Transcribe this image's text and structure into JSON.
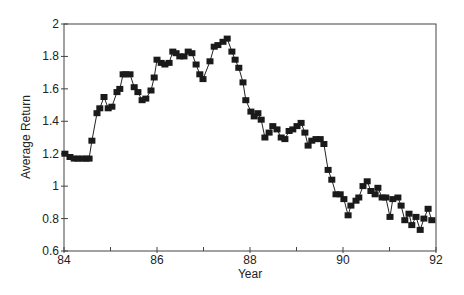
{
  "chart_data": {
    "type": "line",
    "title": "",
    "xlabel": "Year",
    "ylabel": "Average Return",
    "xlim": [
      84,
      92
    ],
    "ylim": [
      0.6,
      2
    ],
    "xticks": [
      84,
      86,
      88,
      90,
      92
    ],
    "xticks_minor": [
      85,
      87,
      89,
      91
    ],
    "yticks": [
      0.6,
      0.8,
      1,
      1.2,
      1.4,
      1.6,
      1.8,
      2
    ],
    "ytick_labels": [
      "0.6",
      "0.8",
      "1",
      "1.2",
      "1.4",
      "1.6",
      "1.8",
      "2"
    ],
    "xtick_labels": [
      "84",
      "86",
      "88",
      "90",
      "92"
    ],
    "grid": false,
    "legend": null,
    "marker": "square",
    "series": [
      {
        "name": "Average Return",
        "color": "#1a1a1a",
        "x": [
          84.02,
          84.13,
          84.22,
          84.3,
          84.39,
          84.47,
          84.54,
          84.6,
          84.71,
          84.77,
          84.86,
          84.95,
          85.03,
          85.14,
          85.2,
          85.27,
          85.33,
          85.42,
          85.51,
          85.59,
          85.68,
          85.76,
          85.87,
          85.94,
          86.0,
          86.09,
          86.17,
          86.26,
          86.34,
          86.41,
          86.49,
          86.58,
          86.67,
          86.75,
          86.84,
          86.92,
          86.99,
          87.14,
          87.23,
          87.31,
          87.42,
          87.51,
          87.61,
          87.68,
          87.76,
          87.85,
          87.91,
          88.02,
          88.09,
          88.17,
          88.24,
          88.32,
          88.41,
          88.49,
          88.58,
          88.67,
          88.75,
          88.84,
          88.92,
          89.01,
          89.1,
          89.18,
          89.25,
          89.33,
          89.42,
          89.51,
          89.59,
          89.68,
          89.76,
          89.85,
          89.94,
          90.02,
          90.11,
          90.17,
          90.28,
          90.34,
          90.43,
          90.52,
          90.6,
          90.69,
          90.75,
          90.84,
          90.92,
          91.01,
          91.07,
          91.18,
          91.25,
          91.33,
          91.42,
          91.48,
          91.57,
          91.66,
          91.74,
          91.83,
          91.91
        ],
        "values": [
          1.2,
          1.18,
          1.17,
          1.17,
          1.17,
          1.17,
          1.17,
          1.28,
          1.45,
          1.48,
          1.55,
          1.48,
          1.49,
          1.58,
          1.6,
          1.69,
          1.69,
          1.69,
          1.61,
          1.58,
          1.53,
          1.54,
          1.59,
          1.67,
          1.78,
          1.76,
          1.75,
          1.76,
          1.83,
          1.82,
          1.8,
          1.8,
          1.83,
          1.82,
          1.75,
          1.69,
          1.66,
          1.77,
          1.86,
          1.87,
          1.89,
          1.91,
          1.83,
          1.78,
          1.73,
          1.64,
          1.53,
          1.46,
          1.43,
          1.45,
          1.41,
          1.3,
          1.33,
          1.37,
          1.35,
          1.3,
          1.29,
          1.34,
          1.35,
          1.37,
          1.39,
          1.33,
          1.25,
          1.28,
          1.29,
          1.29,
          1.26,
          1.1,
          1.04,
          0.95,
          0.95,
          0.92,
          0.82,
          0.88,
          0.91,
          0.93,
          1.0,
          1.03,
          0.97,
          0.95,
          0.99,
          0.93,
          0.93,
          0.81,
          0.92,
          0.93,
          0.88,
          0.79,
          0.83,
          0.76,
          0.81,
          0.73,
          0.8,
          0.86,
          0.79
        ]
      }
    ]
  }
}
